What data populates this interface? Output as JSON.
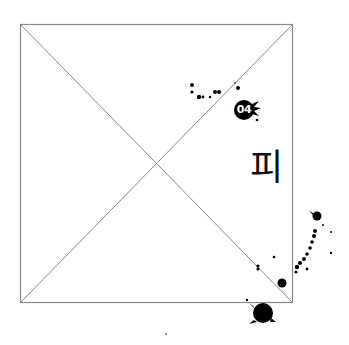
{
  "frame": {
    "x": 20,
    "y": 24,
    "width": 272,
    "height": 278,
    "stroke": "#8a8a8a"
  },
  "badge": {
    "number": "04",
    "color": "#000000",
    "text_color": "#ffffff"
  },
  "glyph": {
    "character": "피"
  },
  "ink_color": "#000000"
}
